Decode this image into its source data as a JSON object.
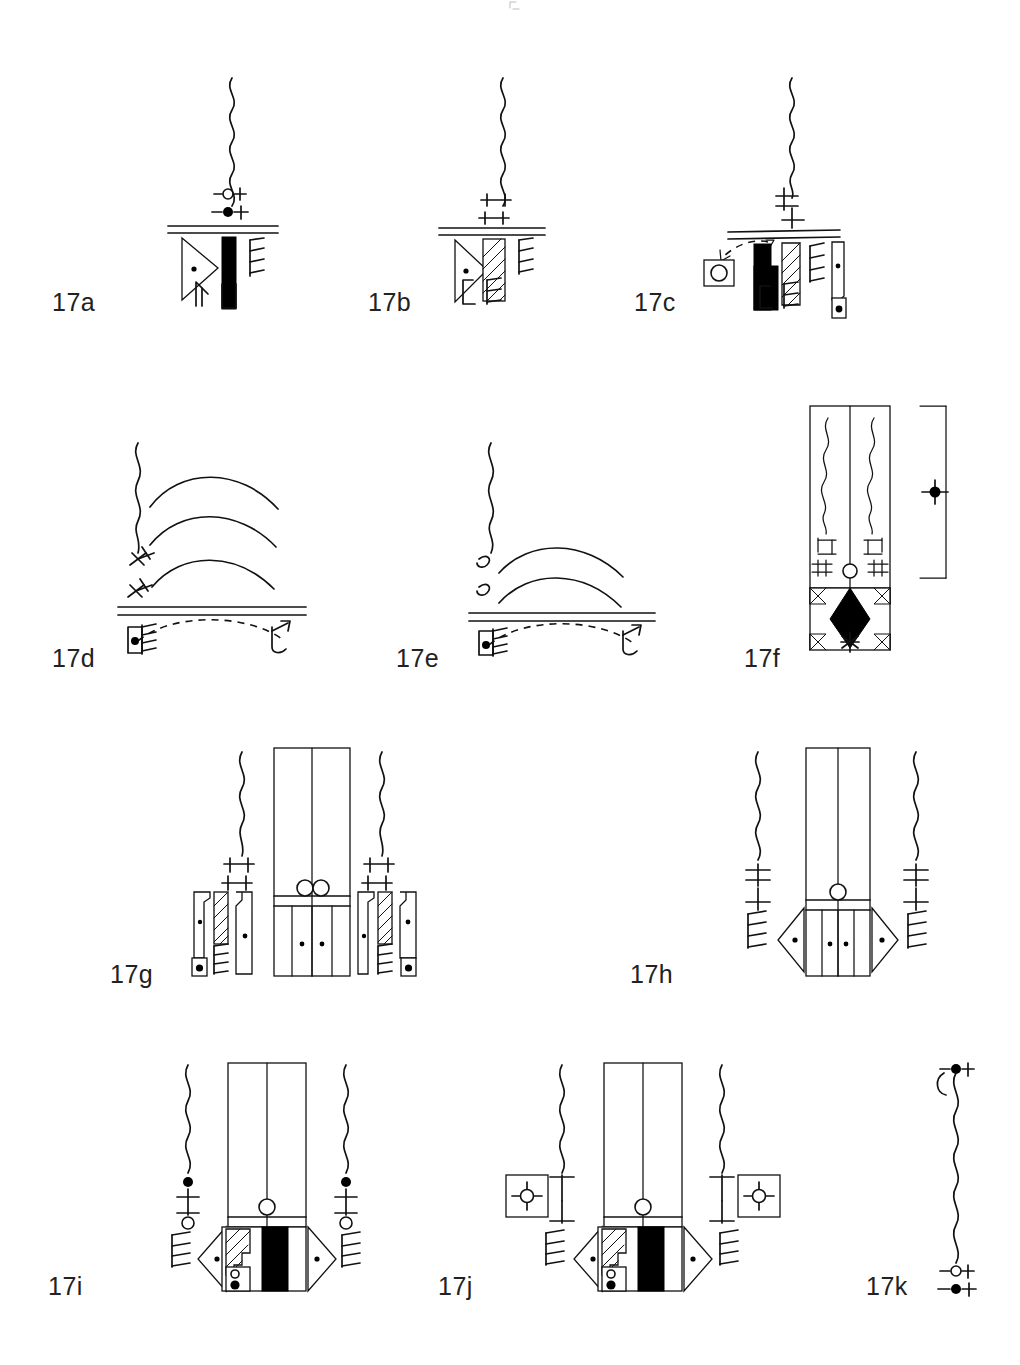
{
  "figure": {
    "caption_visible": false,
    "background_color": "#ffffff",
    "ink_color": "#111111",
    "width": 1020,
    "height": 1365,
    "panel_count": 11
  },
  "panels": [
    {
      "id": "17a",
      "label": "17a",
      "label_x": 52,
      "label_y": 288,
      "row": 1,
      "column": 1,
      "description": "single wavy vertical stem above a double horizontal groundline; two small bead-and-cross markers on stem; below line a dotted triangle blade, a solid black bar, a comb/feather element, plus two small base glyphs",
      "elements": [
        {
          "name": "wavy-stem",
          "count": 1
        },
        {
          "name": "open-bead-cross-marker",
          "count": 1
        },
        {
          "name": "filled-bead-cross-marker",
          "count": 1
        },
        {
          "name": "double-groundline",
          "count": 1
        },
        {
          "name": "dotted-triangle-blade",
          "count": 1
        },
        {
          "name": "solid-black-bar",
          "count": 1
        },
        {
          "name": "comb-feather",
          "count": 1
        },
        {
          "name": "base-hook-glyph",
          "count": 1
        },
        {
          "name": "base-dot-box-glyph",
          "count": 1
        }
      ]
    },
    {
      "id": "17b",
      "label": "17b",
      "label_x": 368,
      "label_y": 288,
      "row": 1,
      "column": 2,
      "description": "wavy stem with two double-bar (T/I) markers; double groundline; dotted triangle blade, hatched bar, comb element and two base hook glyphs",
      "elements": [
        {
          "name": "wavy-stem",
          "count": 1
        },
        {
          "name": "double-bar-marker",
          "count": 2
        },
        {
          "name": "double-groundline",
          "count": 1
        },
        {
          "name": "dotted-triangle-blade",
          "count": 1
        },
        {
          "name": "hatched-bar",
          "count": 1
        },
        {
          "name": "comb-feather",
          "count": 1
        },
        {
          "name": "base-hook-glyph",
          "count": 2
        }
      ]
    },
    {
      "id": "17c",
      "label": "17c",
      "label_x": 634,
      "label_y": 288,
      "row": 1,
      "column": 3,
      "description": "wavy stem with two cross-bar markers; long double groundline; callout arrow with dashed leader pointing to a boxed ring detail; solid black bar, hatched bar, comb element, base hooks and a separate dotted blade with dot-box base",
      "elements": [
        {
          "name": "wavy-stem",
          "count": 1
        },
        {
          "name": "cross-bar-marker",
          "count": 2
        },
        {
          "name": "double-groundline",
          "count": 1
        },
        {
          "name": "dashed-callout-leader",
          "count": 1
        },
        {
          "name": "boxed-ring-detail",
          "count": 1
        },
        {
          "name": "solid-black-bar",
          "count": 1
        },
        {
          "name": "hatched-bar",
          "count": 1
        },
        {
          "name": "comb-feather",
          "count": 1
        },
        {
          "name": "base-hook-glyph",
          "count": 2
        },
        {
          "name": "dotted-blade",
          "count": 1
        },
        {
          "name": "base-dot-box-glyph",
          "count": 1
        }
      ]
    },
    {
      "id": "17d",
      "label": "17d",
      "label_x": 52,
      "label_y": 644,
      "row": 2,
      "column": 1,
      "description": "wavy stem at left with three nested arcs to the right; two x-cross markers on the stem; double groundline; dashed arc below linking a dot-box hatched glyph on the left to a hooked glyph on the right",
      "elements": [
        {
          "name": "wavy-stem",
          "count": 1
        },
        {
          "name": "nested-arc",
          "count": 3
        },
        {
          "name": "x-cross-marker",
          "count": 2
        },
        {
          "name": "double-groundline",
          "count": 1
        },
        {
          "name": "dashed-arc-link",
          "count": 1
        },
        {
          "name": "dot-box-hatched-glyph",
          "count": 1
        },
        {
          "name": "hooked-arrow-glyph",
          "count": 1
        }
      ]
    },
    {
      "id": "17e",
      "label": "17e",
      "label_x": 396,
      "label_y": 644,
      "row": 2,
      "column": 2,
      "description": "wavy stem with two small s-curl markers and two nested arcs; double groundline; dashed arc below linking a dot-box hatched glyph to a hooked glyph",
      "elements": [
        {
          "name": "wavy-stem",
          "count": 1
        },
        {
          "name": "nested-arc",
          "count": 2
        },
        {
          "name": "s-curl-marker",
          "count": 2
        },
        {
          "name": "double-groundline",
          "count": 1
        },
        {
          "name": "dashed-arc-link",
          "count": 1
        },
        {
          "name": "dot-box-hatched-glyph",
          "count": 1
        },
        {
          "name": "hooked-arrow-glyph",
          "count": 1
        }
      ]
    },
    {
      "id": "17f",
      "label": "17f",
      "label_x": 744,
      "label_y": 644,
      "row": 2,
      "column": 3,
      "description": "tall rectangular panel split by a centre line containing two wavy stems with paired T and double-bar markers, a central open ring at the division, and a lower compartment with a solid black lozenge, corner triangles and a star/asterisk; a bracket with a dot-cross marker sits to the right",
      "elements": [
        {
          "name": "rectangular-frame",
          "count": 1
        },
        {
          "name": "centre-divider-line",
          "count": 1
        },
        {
          "name": "wavy-stem",
          "count": 2
        },
        {
          "name": "t-bar-marker",
          "count": 2
        },
        {
          "name": "double-bar-marker",
          "count": 2
        },
        {
          "name": "centre-ring",
          "count": 1
        },
        {
          "name": "lower-compartment",
          "count": 1
        },
        {
          "name": "solid-black-lozenge",
          "count": 1
        },
        {
          "name": "corner-triangle",
          "count": 4
        },
        {
          "name": "asterisk-star",
          "count": 1
        },
        {
          "name": "measurement-bracket",
          "count": 1
        },
        {
          "name": "dot-cross-marker",
          "count": 1
        }
      ]
    },
    {
      "id": "17g",
      "label": "17g",
      "label_x": 110,
      "label_y": 968,
      "row": 3,
      "column": 1,
      "description": "central tall rectangle with centre divider, two open rings at the mid transverse band, and a lower band divided into four cells with two dots; flanked left and right by mirrored assemblies of wavy stem, double-bar markers, dotted blade, hatched bar, comb and dot-box base glyphs",
      "elements": [
        {
          "name": "central-rectangle",
          "count": 1
        },
        {
          "name": "centre-divider-line",
          "count": 1
        },
        {
          "name": "transverse-band",
          "count": 1
        },
        {
          "name": "paired-rings",
          "count": 1
        },
        {
          "name": "lower-cell",
          "count": 4
        },
        {
          "name": "cell-dot",
          "count": 2
        },
        {
          "name": "flanking-assembly",
          "count": 2
        },
        {
          "name": "wavy-stem",
          "count": 2
        },
        {
          "name": "double-bar-marker",
          "count": 4
        },
        {
          "name": "dotted-blade",
          "count": 4
        },
        {
          "name": "hatched-bar",
          "count": 2
        },
        {
          "name": "comb-feather",
          "count": 2
        },
        {
          "name": "base-dot-box-glyph",
          "count": 2
        }
      ]
    },
    {
      "id": "17h",
      "label": "17h",
      "label_x": 630,
      "label_y": 968,
      "row": 3,
      "column": 2,
      "description": "central tall rectangle with centre divider, a single open ring at the transverse band and a lower band of four cells with two dots; flanked by mirrored wavy stems with T-bar and cross markers, comb elements and dotted triangular blades",
      "elements": [
        {
          "name": "central-rectangle",
          "count": 1
        },
        {
          "name": "centre-divider-line",
          "count": 1
        },
        {
          "name": "transverse-band",
          "count": 1
        },
        {
          "name": "centre-ring",
          "count": 1
        },
        {
          "name": "lower-cell",
          "count": 4
        },
        {
          "name": "cell-dot",
          "count": 2
        },
        {
          "name": "wavy-stem",
          "count": 2
        },
        {
          "name": "t-bar-marker",
          "count": 2
        },
        {
          "name": "cross-bar-marker",
          "count": 2
        },
        {
          "name": "comb-feather",
          "count": 2
        },
        {
          "name": "dotted-triangle-blade",
          "count": 2
        }
      ]
    },
    {
      "id": "17i",
      "label": "17i",
      "label_x": 48,
      "label_y": 1282,
      "row": 4,
      "column": 1,
      "description": "central tall rectangle with centre divider and open ring, lower band containing a hatched step block, a small dot-and-ring box and a broad solid black panel; flanked by wavy stems carrying filled bead, cross and open ring markers, comb elements and dotted triangular blades",
      "elements": [
        {
          "name": "central-rectangle",
          "count": 1
        },
        {
          "name": "centre-divider-line",
          "count": 1
        },
        {
          "name": "centre-ring",
          "count": 1
        },
        {
          "name": "lower-band",
          "count": 1
        },
        {
          "name": "hatched-step-block",
          "count": 1
        },
        {
          "name": "dot-ring-box",
          "count": 1
        },
        {
          "name": "solid-black-panel",
          "count": 1
        },
        {
          "name": "wavy-stem",
          "count": 2
        },
        {
          "name": "filled-bead-marker",
          "count": 2
        },
        {
          "name": "cross-marker",
          "count": 2
        },
        {
          "name": "open-ring-marker",
          "count": 2
        },
        {
          "name": "comb-feather",
          "count": 2
        },
        {
          "name": "dotted-triangle-blade",
          "count": 2
        }
      ]
    },
    {
      "id": "17j",
      "label": "17j",
      "label_x": 438,
      "label_y": 1282,
      "row": 4,
      "column": 2,
      "description": "same central construction as 17i with centre ring and black panel; flanked by wavy stems with T-bar markers and boxed dot-cross callout squares at left and right",
      "elements": [
        {
          "name": "central-rectangle",
          "count": 1
        },
        {
          "name": "centre-divider-line",
          "count": 1
        },
        {
          "name": "centre-ring",
          "count": 1
        },
        {
          "name": "lower-band",
          "count": 1
        },
        {
          "name": "hatched-step-block",
          "count": 1
        },
        {
          "name": "dot-ring-box",
          "count": 1
        },
        {
          "name": "solid-black-panel",
          "count": 1
        },
        {
          "name": "wavy-stem",
          "count": 2
        },
        {
          "name": "t-bar-marker",
          "count": 4
        },
        {
          "name": "boxed-dot-cross-callout",
          "count": 2
        },
        {
          "name": "comb-feather",
          "count": 2
        },
        {
          "name": "dotted-triangle-blade",
          "count": 2
        }
      ]
    },
    {
      "id": "17k",
      "label": "17k",
      "label_x": 866,
      "label_y": 1282,
      "row": 4,
      "column": 3,
      "description": "a single long wavy cord with a filled bead-and-cross marker at the top hooked end, and an open bead-cross plus filled bead-cross marker pair at the bottom",
      "elements": [
        {
          "name": "wavy-cord",
          "count": 1
        },
        {
          "name": "top-hook",
          "count": 1
        },
        {
          "name": "filled-bead-cross-marker",
          "count": 2
        },
        {
          "name": "open-bead-cross-marker",
          "count": 1
        }
      ]
    }
  ]
}
